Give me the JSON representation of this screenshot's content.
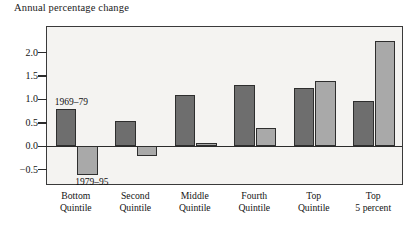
{
  "chart_data": {
    "type": "bar",
    "title": "Annual percentage change",
    "xlabel": "",
    "ylabel": "Annual percentage change",
    "ylim": [
      -0.85,
      2.55
    ],
    "yticks": [
      -0.5,
      0.0,
      0.5,
      1.0,
      1.5,
      2.0
    ],
    "ytick_labels": [
      "−0.5",
      "0.0",
      "0.5",
      "1.0",
      "1.5",
      "2.0"
    ],
    "grid": false,
    "legend_position": "inline-annotation",
    "categories": [
      "Bottom Quintile",
      "Second Quintile",
      "Middle Quintile",
      "Fourth Quintile",
      "Top Quintile",
      "Top 5 percent"
    ],
    "category_lines": [
      [
        "Bottom",
        "Quintile"
      ],
      [
        "Second",
        "Quintile"
      ],
      [
        "Middle",
        "Quintile"
      ],
      [
        "Fourth",
        "Quintile"
      ],
      [
        "Top",
        "Quintile"
      ],
      [
        "Top",
        "5 percent"
      ]
    ],
    "series": [
      {
        "name": "1969–79",
        "color": "#6e6e6e",
        "values": [
          0.8,
          0.55,
          1.1,
          1.3,
          1.25,
          0.97
        ]
      },
      {
        "name": "1979–95",
        "color": "#a9a9a9",
        "values": [
          -0.62,
          -0.2,
          0.08,
          0.4,
          1.4,
          2.25
        ]
      }
    ],
    "annotations": [
      {
        "text": "1969–79",
        "series": "1969–79"
      },
      {
        "text": "1979–95",
        "series": "1979–95"
      }
    ]
  },
  "colors": {
    "series_1969_79": "#6e6e6e",
    "series_1979_95": "#a9a9a9",
    "plot_background": "#f4f3f1",
    "frame": "#3a3a3a",
    "axis": "#2b2b2b",
    "text": "#111111"
  }
}
